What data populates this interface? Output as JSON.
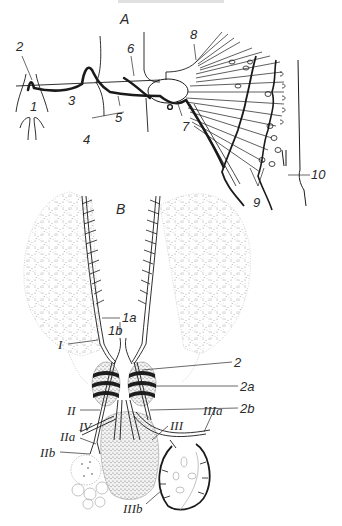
{
  "figure": {
    "colors": {
      "ink": "#1a1a1a",
      "label": "#2a2a2a",
      "stipple": "#9a9a9a",
      "background": "#ffffff"
    },
    "panels": [
      {
        "id": "A",
        "label": "A",
        "labels": [
          {
            "key": "a1",
            "text": "1",
            "x": 30,
            "y": 105
          },
          {
            "key": "a2",
            "text": "2",
            "x": 16,
            "y": 42
          },
          {
            "key": "a3",
            "text": "3",
            "x": 68,
            "y": 94
          },
          {
            "key": "a4",
            "text": "4",
            "x": 83,
            "y": 133
          },
          {
            "key": "a5",
            "text": "5",
            "x": 115,
            "y": 113
          },
          {
            "key": "a6",
            "text": "6",
            "x": 127,
            "y": 42
          },
          {
            "key": "a7",
            "text": "7",
            "x": 182,
            "y": 126
          },
          {
            "key": "a8",
            "text": "8",
            "x": 190,
            "y": 28
          },
          {
            "key": "a9",
            "text": "9",
            "x": 253,
            "y": 200
          },
          {
            "key": "a10",
            "text": "10",
            "x": 311,
            "y": 172
          }
        ]
      },
      {
        "id": "B",
        "label": "B",
        "labels": [
          {
            "key": "b1a",
            "text": "1a",
            "x": 122,
            "y": 312
          },
          {
            "key": "b1b",
            "text": "1b",
            "x": 108,
            "y": 326
          },
          {
            "key": "bI",
            "text": "I",
            "x": 58,
            "y": 340
          },
          {
            "key": "b2",
            "text": "2",
            "x": 234,
            "y": 358
          },
          {
            "key": "b2a",
            "text": "2a",
            "x": 240,
            "y": 382
          },
          {
            "key": "b2b",
            "text": "2b",
            "x": 240,
            "y": 404
          },
          {
            "key": "bII",
            "text": "II",
            "x": 67,
            "y": 406
          },
          {
            "key": "bIV",
            "text": "IV",
            "x": 79,
            "y": 422
          },
          {
            "key": "bIIa",
            "text": "IIa",
            "x": 60,
            "y": 432
          },
          {
            "key": "bIIb",
            "text": "IIb",
            "x": 40,
            "y": 448
          },
          {
            "key": "bIII",
            "text": "III",
            "x": 170,
            "y": 421
          },
          {
            "key": "bIIIa",
            "text": "IIIa",
            "x": 203,
            "y": 406
          },
          {
            "key": "bIIIb",
            "text": "IIIb",
            "x": 123,
            "y": 504
          }
        ]
      }
    ]
  }
}
